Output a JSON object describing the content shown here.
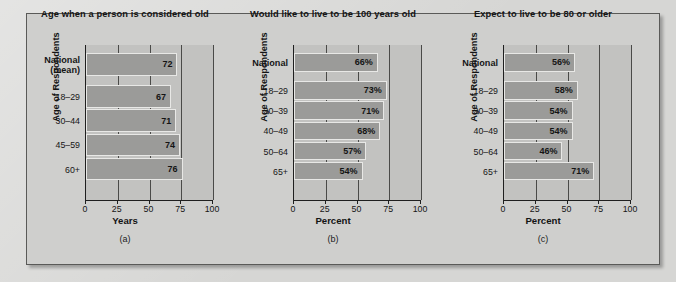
{
  "figure": {
    "background_color": "#cfcfcd",
    "plot_background_color": "#c2c2c0",
    "bar_color": "#9b9b99",
    "axis_color": "#1f1f1f"
  },
  "panels": [
    {
      "id": "a",
      "caption": "(a)",
      "title": "Age when a person is considered old",
      "ylabel": "Age of Respondents",
      "xlabel": "Years",
      "chart_data": {
        "type": "bar",
        "orientation": "horizontal",
        "title": "Age when a person is considered old",
        "xlabel": "Years",
        "ylabel": "Age of Respondents",
        "xlim": [
          0,
          100
        ],
        "xticks": [
          0,
          25,
          50,
          75,
          100
        ],
        "ticklabels": [
          "0",
          "25",
          "50",
          "75",
          "100"
        ],
        "grid": true,
        "categories": [
          "National (mean)",
          "18–29",
          "30–44",
          "45–59",
          "60+"
        ],
        "values": [
          72,
          67,
          71,
          74,
          76
        ],
        "value_labels": [
          "72",
          "67",
          "71",
          "74",
          "76"
        ],
        "legend": false
      }
    },
    {
      "id": "b",
      "caption": "(b)",
      "title": "Would like to live to be 100 years old",
      "ylabel": "Age of Respondents",
      "xlabel": "Percent",
      "chart_data": {
        "type": "bar",
        "orientation": "horizontal",
        "title": "Would like to live to be 100 years old",
        "xlabel": "Percent",
        "ylabel": "Age of Respondents",
        "xlim": [
          0,
          100
        ],
        "xticks": [
          0,
          25,
          50,
          75,
          100
        ],
        "ticklabels": [
          "0",
          "25",
          "50",
          "75",
          "100"
        ],
        "grid": true,
        "categories": [
          "National",
          "18–29",
          "30–39",
          "40–49",
          "50–64",
          "65+"
        ],
        "values": [
          66,
          73,
          71,
          68,
          57,
          54
        ],
        "value_labels": [
          "66%",
          "73%",
          "71%",
          "68%",
          "57%",
          "54%"
        ],
        "legend": false
      }
    },
    {
      "id": "c",
      "caption": "(c)",
      "title": "Expect to live to be 80 or older",
      "ylabel": "Age of Respondents",
      "xlabel": "Percent",
      "chart_data": {
        "type": "bar",
        "orientation": "horizontal",
        "title": "Expect to live to be 80 or older",
        "xlabel": "Percent",
        "ylabel": "Age of Respondents",
        "xlim": [
          0,
          100
        ],
        "xticks": [
          0,
          25,
          50,
          75,
          100
        ],
        "ticklabels": [
          "0",
          "25",
          "50",
          "75",
          "100"
        ],
        "grid": true,
        "categories": [
          "National",
          "18–29",
          "30–39",
          "40–49",
          "50–64",
          "65+"
        ],
        "values": [
          56,
          58,
          54,
          54,
          46,
          71
        ],
        "value_labels": [
          "56%",
          "58%",
          "54%",
          "54%",
          "46%",
          "71%"
        ],
        "legend": false
      }
    }
  ]
}
